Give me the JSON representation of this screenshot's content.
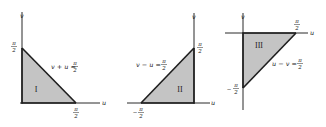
{
  "figure": {
    "panels": [
      {
        "id": "I",
        "region_label": "I",
        "axis_x_label": "u",
        "axis_y_label": "v",
        "boundary_equation": {
          "lhs": "v + u =",
          "num": "π",
          "den": "2"
        },
        "tick_labels": [
          {
            "axis": "v",
            "num": "π",
            "den": "2",
            "sign": ""
          },
          {
            "axis": "u",
            "num": "π",
            "den": "2",
            "sign": ""
          }
        ]
      },
      {
        "id": "II",
        "region_label": "II",
        "axis_x_label": "u",
        "axis_y_label": "v",
        "boundary_equation": {
          "lhs": "v − u =",
          "num": "π",
          "den": "2"
        },
        "tick_labels": [
          {
            "axis": "v",
            "num": "π",
            "den": "2",
            "sign": ""
          },
          {
            "axis": "u",
            "num": "π",
            "den": "2",
            "sign": "−"
          }
        ]
      },
      {
        "id": "III",
        "region_label": "III",
        "axis_x_label": "u",
        "axis_y_label": "v",
        "boundary_equation": {
          "lhs": "u − v =",
          "num": "π",
          "den": "2"
        },
        "tick_labels": [
          {
            "axis": "u",
            "num": "π",
            "den": "2",
            "sign": ""
          },
          {
            "axis": "v",
            "num": "π",
            "den": "2",
            "sign": "−"
          }
        ]
      }
    ],
    "colors": {
      "fill": "#c4c4c4",
      "line": "#1e1e1e",
      "axis": "#2a2a2a"
    }
  }
}
